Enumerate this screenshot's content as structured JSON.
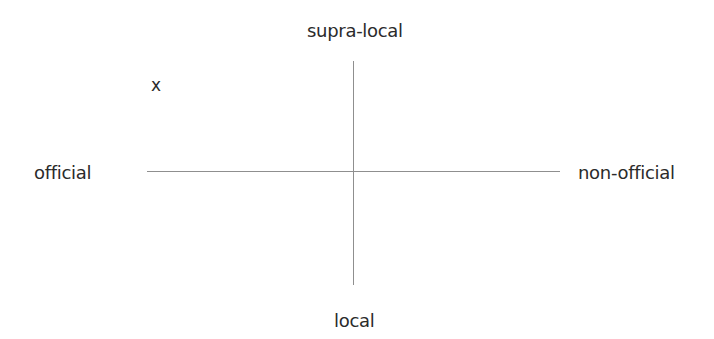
{
  "diagram": {
    "type": "quadrant",
    "axes": {
      "vertical": {
        "top_label": "supra-local",
        "bottom_label": "local"
      },
      "horizontal": {
        "left_label": "official",
        "right_label": "non-official"
      }
    },
    "markers": [
      {
        "symbol": "x",
        "quadrant": "top-left",
        "meaning_axes": [
          "official",
          "supra-local"
        ]
      }
    ],
    "colors": {
      "line": "#8f8f8f",
      "text": "#2b2b2b",
      "background": "#ffffff"
    }
  }
}
